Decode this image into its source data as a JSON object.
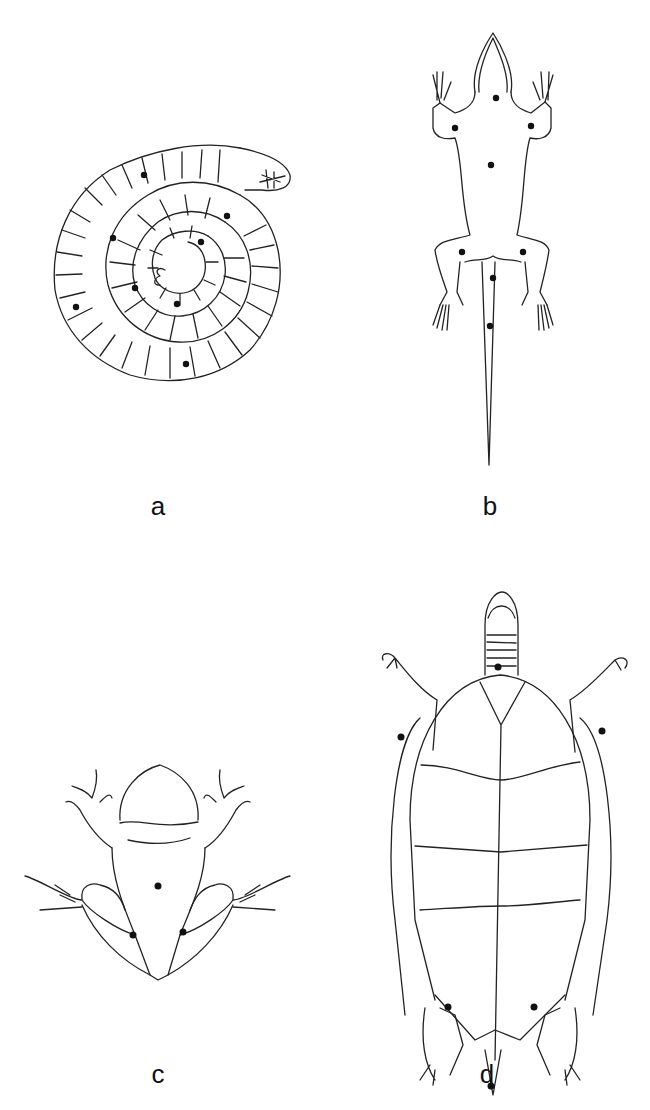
{
  "figure": {
    "panels": [
      {
        "id": "a",
        "label": "a",
        "subject": "coiled caecilian / limbless amphibian, ventral view",
        "marker_count": 9
      },
      {
        "id": "b",
        "label": "b",
        "subject": "lizard, ventral view",
        "marker_count": 8
      },
      {
        "id": "c",
        "label": "c",
        "subject": "frog, ventral view",
        "marker_count": 3
      },
      {
        "id": "d",
        "label": "d",
        "subject": "turtle, ventral view (plastron)",
        "marker_count": 6
      }
    ],
    "colors": {
      "line": "#222222",
      "marker": "#111111",
      "background": "#ffffff"
    }
  }
}
